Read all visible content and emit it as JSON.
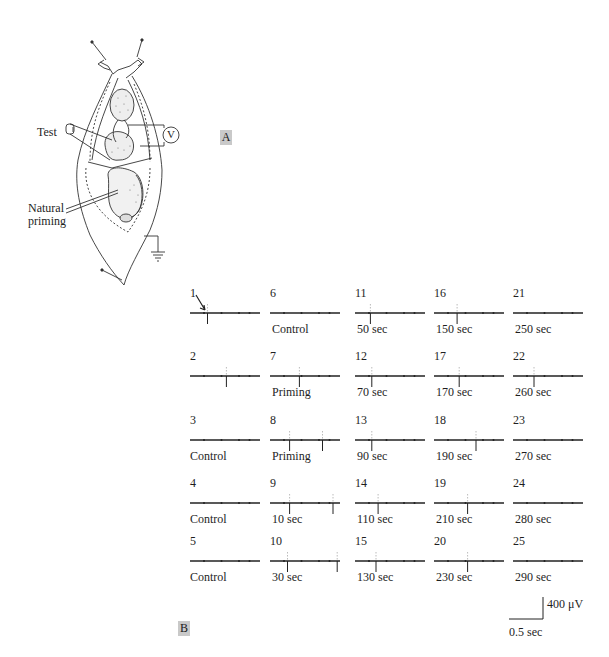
{
  "panel_a": {
    "label": "A",
    "labels": {
      "test": "Test",
      "voltmeter": "V",
      "natural_priming_1": "Natural",
      "natural_priming_2": "priming"
    }
  },
  "panel_b": {
    "label": "B",
    "scale_bar": {
      "vertical": "400 μV",
      "horizontal": "0.5 sec"
    },
    "traces": [
      {
        "n": "1",
        "label": "",
        "spikes": [
          0.25
        ],
        "arrow": true
      },
      {
        "n": "2",
        "label": "",
        "spikes": [
          0.52
        ]
      },
      {
        "n": "3",
        "label": "Control",
        "spikes": []
      },
      {
        "n": "4",
        "label": "Control",
        "spikes": []
      },
      {
        "n": "5",
        "label": "Control",
        "spikes": []
      },
      {
        "n": "6",
        "label": "Control",
        "spikes": []
      },
      {
        "n": "7",
        "label": "Priming",
        "spikes": [
          0.42
        ]
      },
      {
        "n": "8",
        "label": "Priming",
        "spikes": [
          0.28,
          0.75
        ]
      },
      {
        "n": "9",
        "label": "10 sec",
        "spikes": [
          0.28,
          0.9
        ]
      },
      {
        "n": "10",
        "label": "30 sec",
        "spikes": [
          0.25,
          0.96
        ]
      },
      {
        "n": "11",
        "label": "50 sec",
        "spikes": [
          0.22
        ]
      },
      {
        "n": "12",
        "label": "70 sec",
        "spikes": [
          0.24
        ]
      },
      {
        "n": "13",
        "label": "90 sec",
        "spikes": [
          0.24
        ]
      },
      {
        "n": "14",
        "label": "110 sec",
        "spikes": [
          0.33
        ]
      },
      {
        "n": "15",
        "label": "130 sec",
        "spikes": [
          0.3
        ]
      },
      {
        "n": "16",
        "label": "150 sec",
        "spikes": [
          0.33
        ]
      },
      {
        "n": "17",
        "label": "170 sec",
        "spikes": [
          0.36
        ]
      },
      {
        "n": "18",
        "label": "190 sec",
        "spikes": [
          0.6
        ]
      },
      {
        "n": "19",
        "label": "210 sec",
        "spikes": [
          0.48
        ]
      },
      {
        "n": "20",
        "label": "230 sec",
        "spikes": [
          0.48
        ]
      },
      {
        "n": "21",
        "label": "250 sec",
        "spikes": []
      },
      {
        "n": "22",
        "label": "260 sec",
        "spikes": [
          0.3
        ]
      },
      {
        "n": "23",
        "label": "270 sec",
        "spikes": []
      },
      {
        "n": "24",
        "label": "280 sec",
        "spikes": []
      },
      {
        "n": "25",
        "label": "290 sec",
        "spikes": []
      }
    ]
  }
}
